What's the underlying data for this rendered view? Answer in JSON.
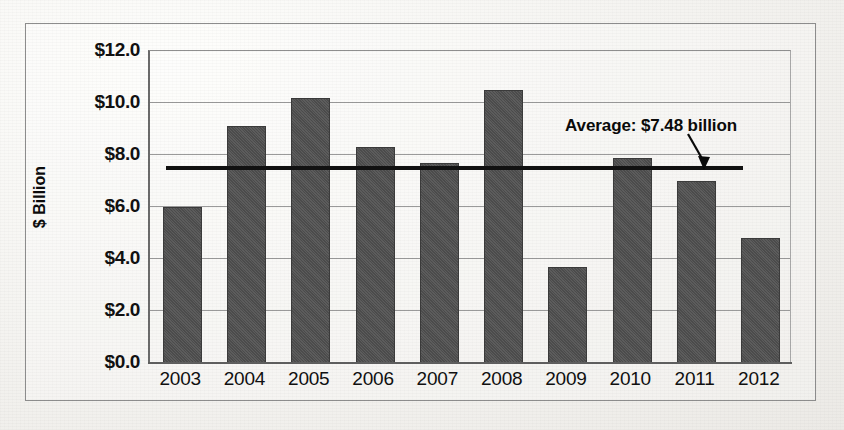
{
  "chart_data": {
    "type": "bar",
    "title": "",
    "subtitle": "",
    "xlabel": "",
    "ylabel": "$ Billion",
    "categories": [
      "2003",
      "2004",
      "2005",
      "2006",
      "2007",
      "2008",
      "2009",
      "2010",
      "2011",
      "2012"
    ],
    "values": [
      6.0,
      9.1,
      10.2,
      8.3,
      7.7,
      10.5,
      3.7,
      7.9,
      7.0,
      4.8
    ],
    "ylim": [
      0.0,
      12.0
    ],
    "ytick_labels": [
      "$12.0",
      "$10.0",
      "$8.0",
      "$6.0",
      "$4.0",
      "$2.0",
      "$0.0"
    ],
    "ytick_values": [
      12.0,
      10.0,
      8.0,
      6.0,
      4.0,
      2.0,
      0.0
    ],
    "grid": true,
    "legend": "none",
    "annotations": [
      {
        "name": "average-line",
        "label": "Average: $7.48 billion",
        "value": 7.48,
        "style": "horizontal-rule-with-arrow"
      }
    ],
    "colors": {
      "bar_fill": "#535353",
      "bar_edge": "#3b3b3b",
      "average_line": "#111111",
      "gridline": "#9a9a9a",
      "axis": "#5f5f5f",
      "text": "#101010",
      "background": "#f4f3f0"
    }
  }
}
